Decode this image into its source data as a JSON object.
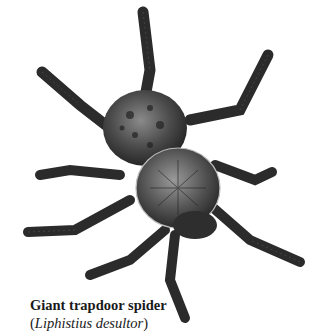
{
  "figure": {
    "caption": {
      "common_name": "Giant trapdoor spider",
      "open_paren": "(",
      "scientific_name": "Liphistius desultor",
      "close_paren": ")"
    },
    "colors": {
      "background": "#ffffff",
      "body_dark": "#2e2e2e",
      "body_mid": "#6a6a6a",
      "body_light": "#a8a8a8",
      "caption_text": "#1a1a1a"
    }
  }
}
